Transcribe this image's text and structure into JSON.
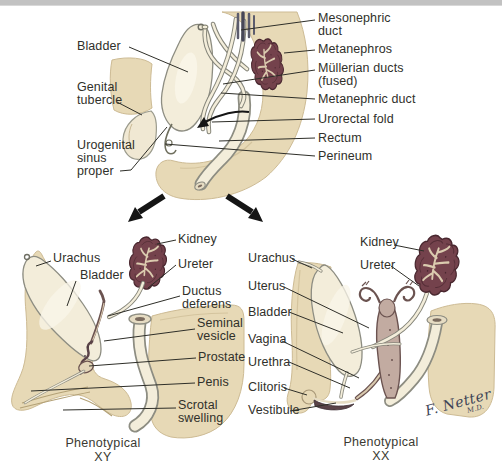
{
  "colors": {
    "body_beige": "#e7d9b6",
    "organ_cream": "#f3edda",
    "kidney_maroon": "#74424c",
    "outline_gray": "#8d8d82",
    "label_text": "#30302a",
    "top_strip": "#c2c2c2"
  },
  "stage1": {
    "labels": {
      "bladder": "Bladder",
      "genital_tubercle": "Genital\ntubercle",
      "urogenital_sinus": "Urogenital\nsinus\nproper",
      "mesonephric_duct": "Mesonephric\nduct",
      "metanephros": "Metanephros",
      "mullerian_ducts": "Müllerian ducts\n(fused)",
      "metanephric_duct": "Metanephric duct",
      "urorectal_fold": "Urorectal fold",
      "rectum": "Rectum",
      "perineum": "Perineum"
    }
  },
  "xy": {
    "caption": "Phenotypical XY",
    "labels": {
      "urachus": "Urachus",
      "bladder": "Bladder",
      "kidney": "Kidney",
      "ureter": "Ureter",
      "ductus_deferens": "Ductus\ndeferens",
      "seminal_vesicle": "Seminal\nvesicle",
      "prostate": "Prostate",
      "penis": "Penis",
      "scrotal_swelling": "Scrotal\nswelling"
    }
  },
  "xx": {
    "caption": "Phenotypical XX",
    "labels": {
      "urachus": "Urachus",
      "uterus": "Uterus",
      "bladder": "Bladder",
      "vagina": "Vagina",
      "urethra": "Urethra",
      "clitoris": "Clitoris",
      "vestibule": "Vestibule",
      "kidney": "Kidney",
      "ureter": "Ureter"
    }
  },
  "signature": {
    "name": "F. Netter",
    "credentials": "M.D."
  }
}
